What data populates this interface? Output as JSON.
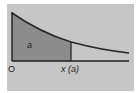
{
  "diagram": {
    "type": "probability-density-area",
    "labels": {
      "origin": "O",
      "x_point": "x (a)",
      "area": "a"
    },
    "colors": {
      "background": "#c6c6c6",
      "shaded_area": "#8c8c8c",
      "curve": "#2a2a2a",
      "axis": "#1e1e1e"
    }
  }
}
